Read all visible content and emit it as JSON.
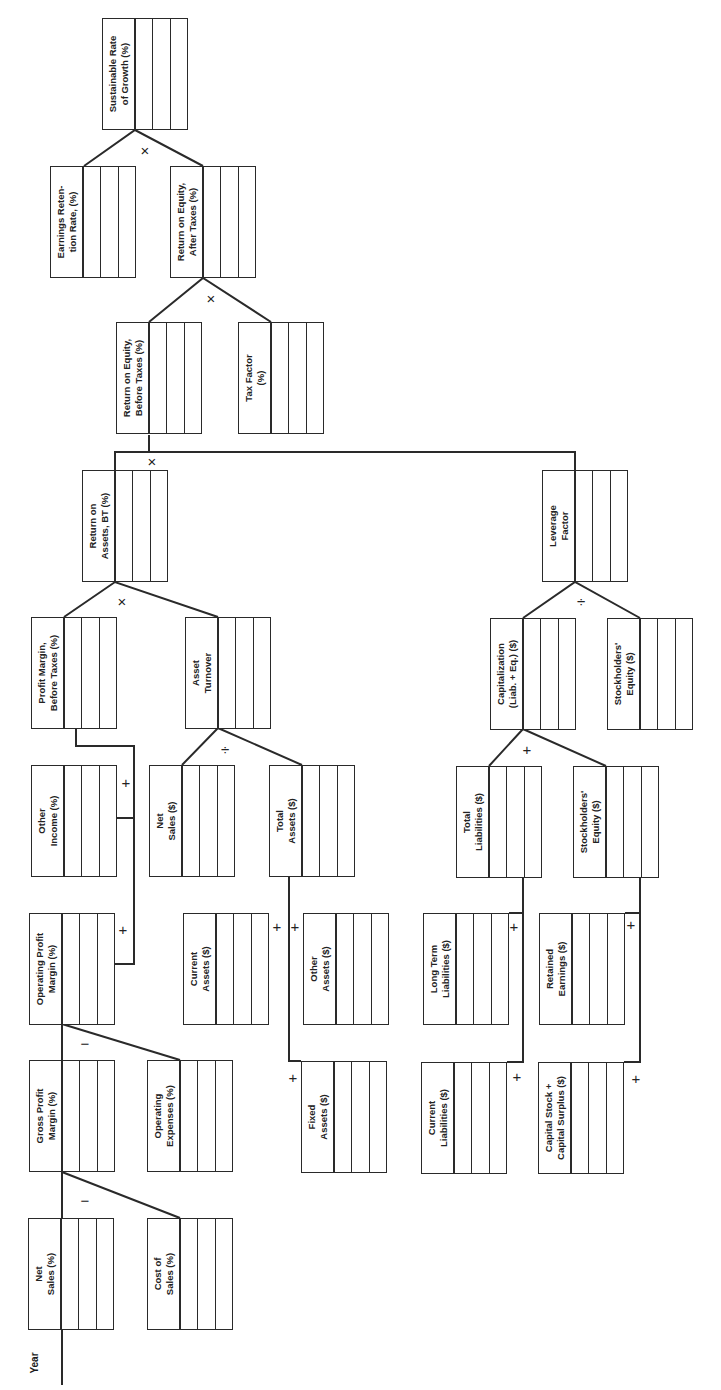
{
  "diagram": {
    "axis_label": "Year",
    "operators": {
      "multiply": "×",
      "divide": "÷",
      "plus": "+",
      "minus": "−"
    },
    "boxes": [
      {
        "id": "sustainable-rate-of-growth",
        "label": "Sustainable Rate\nof Growth (%)",
        "x": 102,
        "y": 18
      },
      {
        "id": "earnings-retention-rate",
        "label": "Earnings Reten-\ntion Rate, (%)",
        "x": 50,
        "y": 166
      },
      {
        "id": "roe-after-taxes",
        "label": "Return on Equity,\nAfter Taxes (%)",
        "x": 170,
        "y": 166
      },
      {
        "id": "roe-before-taxes",
        "label": "Return on Equity,\nBefore Taxes (%)",
        "x": 116,
        "y": 322
      },
      {
        "id": "tax-factor",
        "label": "Tax Factor\n(%)",
        "x": 238,
        "y": 322
      },
      {
        "id": "return-on-assets-bt",
        "label": "Return on\nAssets, BT (%)",
        "x": 82,
        "y": 470
      },
      {
        "id": "leverage-factor",
        "label": "Leverage\nFactor",
        "x": 542,
        "y": 470
      },
      {
        "id": "profit-margin-before-taxes",
        "label": "Profit Margin,\nBefore Taxes (%)",
        "x": 31,
        "y": 617
      },
      {
        "id": "asset-turnover",
        "label": "Asset\nTurnover",
        "x": 185,
        "y": 617
      },
      {
        "id": "capitalization",
        "label": "Capitalization\n(Liab. + Eq.) ($)",
        "x": 490,
        "y": 618
      },
      {
        "id": "stockholders-equity-a",
        "label": "Stockholders'\nEquity ($)",
        "x": 607,
        "y": 618
      },
      {
        "id": "other-income",
        "label": "Other\nIncome (%)",
        "x": 31,
        "y": 765
      },
      {
        "id": "net-sales-dollars",
        "label": "Net\nSales ($)",
        "x": 149,
        "y": 765
      },
      {
        "id": "total-assets",
        "label": "Total\nAssets ($)",
        "x": 269,
        "y": 765
      },
      {
        "id": "total-liabilities",
        "label": "Total\nLiabilities ($)",
        "x": 456,
        "y": 766
      },
      {
        "id": "stockholders-equity-b",
        "label": "Stockholders'\nEquity ($)",
        "x": 573,
        "y": 766
      },
      {
        "id": "operating-profit-margin",
        "label": "Operating Profit\nMargin (%)",
        "x": 29,
        "y": 913
      },
      {
        "id": "current-assets",
        "label": "Current\nAssets ($)",
        "x": 183,
        "y": 913
      },
      {
        "id": "other-assets",
        "label": "Other\nAssets ($)",
        "x": 303,
        "y": 913
      },
      {
        "id": "long-term-liabilities",
        "label": "Long Term\nLiabilities ($)",
        "x": 423,
        "y": 913
      },
      {
        "id": "retained-earnings",
        "label": "Retained\nEarnings ($)",
        "x": 539,
        "y": 913
      },
      {
        "id": "gross-profit-margin",
        "label": "Gross Profit\nMargin (%)",
        "x": 29,
        "y": 1060
      },
      {
        "id": "operating-expenses",
        "label": "Operating\nExpenses (%)",
        "x": 147,
        "y": 1060
      },
      {
        "id": "fixed-assets",
        "label": "Fixed\nAssets ($)",
        "x": 301,
        "y": 1061
      },
      {
        "id": "current-liabilities",
        "label": "Current\nLiabilities ($)",
        "x": 421,
        "y": 1062
      },
      {
        "id": "capital-stock-surplus",
        "label": "Capital Stock +\nCapital Surplus ($)",
        "x": 538,
        "y": 1062
      },
      {
        "id": "net-sales-percent",
        "label": "Net\nSales (%)",
        "x": 28,
        "y": 1218
      },
      {
        "id": "cost-of-sales",
        "label": "Cost of\nSales (%)",
        "x": 147,
        "y": 1218
      }
    ],
    "operator_marks": [
      {
        "symbol": "×",
        "x": 145,
        "y": 150
      },
      {
        "symbol": "×",
        "x": 211,
        "y": 298
      },
      {
        "symbol": "×",
        "x": 152,
        "y": 461
      },
      {
        "symbol": "×",
        "x": 122,
        "y": 601
      },
      {
        "symbol": "÷",
        "x": 225,
        "y": 749
      },
      {
        "symbol": "÷",
        "x": 581,
        "y": 601
      },
      {
        "symbol": "+",
        "x": 126,
        "y": 782
      },
      {
        "symbol": "+",
        "x": 123,
        "y": 929
      },
      {
        "symbol": "+",
        "x": 277,
        "y": 926
      },
      {
        "symbol": "+",
        "x": 295,
        "y": 926
      },
      {
        "symbol": "+",
        "x": 293,
        "y": 1077
      },
      {
        "symbol": "−",
        "x": 85,
        "y": 1043
      },
      {
        "symbol": "−",
        "x": 85,
        "y": 1200
      },
      {
        "symbol": "+",
        "x": 527,
        "y": 749
      },
      {
        "symbol": "+",
        "x": 514,
        "y": 926
      },
      {
        "symbol": "+",
        "x": 517,
        "y": 1076
      },
      {
        "symbol": "+",
        "x": 631,
        "y": 924
      },
      {
        "symbol": "+",
        "x": 636,
        "y": 1078
      }
    ]
  }
}
